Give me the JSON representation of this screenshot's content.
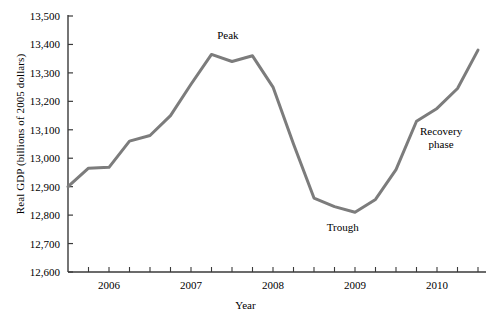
{
  "chart_data": {
    "type": "line",
    "title": "",
    "xlabel": "Year",
    "ylabel": "Real GDP (billions of 2005 dollars)",
    "xlim": [
      2005.5,
      2010.5
    ],
    "ylim": [
      12600,
      13500
    ],
    "grid": false,
    "legend": false,
    "line_color": "#7c7c7c",
    "axis_color": "#3a3a3a",
    "y_ticks": [
      "12,600",
      "12,700",
      "12,800",
      "12,900",
      "13,000",
      "13,100",
      "13,200",
      "13,300",
      "13,400",
      "13,500"
    ],
    "y_tick_values": [
      12600,
      12700,
      12800,
      12900,
      13000,
      13100,
      13200,
      13300,
      13400,
      13500
    ],
    "x_ticks": [
      "2006",
      "2007",
      "2008",
      "2009",
      "2010"
    ],
    "x_tick_values": [
      2006,
      2007,
      2008,
      2009,
      2010
    ],
    "x_minor_tick_interval": 0.25,
    "series": [
      {
        "name": "Real GDP",
        "x": [
          2005.5,
          2005.75,
          2006.0,
          2006.25,
          2006.5,
          2006.75,
          2007.0,
          2007.25,
          2007.5,
          2007.75,
          2008.0,
          2008.25,
          2008.5,
          2008.75,
          2009.0,
          2009.25,
          2009.5,
          2009.75,
          2010.0,
          2010.25,
          2010.5
        ],
        "values": [
          12900,
          12965,
          12968,
          13060,
          13080,
          13150,
          13260,
          13365,
          13340,
          13360,
          13250,
          13050,
          12860,
          12830,
          12810,
          12855,
          12960,
          13130,
          13175,
          13245,
          13380
        ]
      }
    ],
    "annotations": [
      {
        "label": "Peak",
        "x": 2007.45,
        "y": 13420
      },
      {
        "label": "Trough",
        "x": 2008.85,
        "y": 12745
      },
      {
        "label": "Recovery",
        "x": 2010.05,
        "y": 13080
      },
      {
        "label": "phase",
        "x": 2010.05,
        "y": 13035
      }
    ]
  },
  "annotations": {
    "peak": "Peak",
    "trough": "Trough",
    "recovery_line1": "Recovery",
    "recovery_line2": "phase"
  },
  "axes": {
    "x_title": "Year",
    "y_title": "Real GDP (billions of 2005 dollars)"
  }
}
